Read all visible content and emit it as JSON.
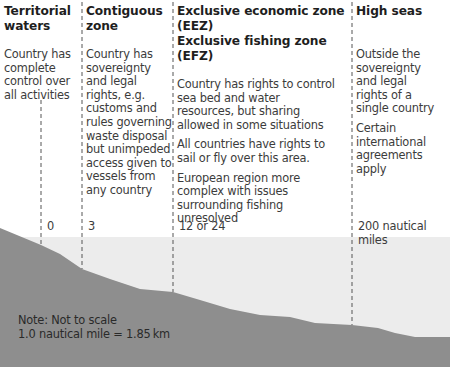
{
  "zones": [
    {
      "id": "territorial",
      "title_lines": [
        "Territorial",
        "waters"
      ],
      "paragraphs": [
        "Country has complete control over all activities"
      ],
      "boundary_label": "0"
    },
    {
      "id": "contiguous",
      "title_lines": [
        "Contiguous",
        "zone"
      ],
      "paragraphs": [
        "Country has sovereignty and legal rights, e.g. customs and rules governing waste disposal but unimpeded access given to vessels from any country"
      ],
      "boundary_label": "3"
    },
    {
      "id": "eez",
      "title_lines": [
        "Exclusive economic zone (EEZ)",
        "Exclusive fishing zone (EFZ)"
      ],
      "paragraphs": [
        "Country has rights to control sea bed and water resources, but sharing allowed in some situations",
        "All countries have rights to sail or fly over this area.",
        "European region more complex with issues surrounding fishing unresolved"
      ],
      "boundary_label": "12 or 24"
    },
    {
      "id": "high-seas",
      "title_lines": [
        "High seas"
      ],
      "paragraphs": [
        "Outside the sovereignty and legal rights of a single country",
        "Certain international agreements apply"
      ],
      "boundary_label": "200 nautical miles"
    }
  ],
  "note": {
    "line1": "Note: Not to scale",
    "line2": "1.0 nautical mile = 1.85 km"
  },
  "colors": {
    "sea": "#ececec",
    "seabed": "#8e8e8e",
    "dash": "#555555",
    "text": "#3c3c3c"
  }
}
